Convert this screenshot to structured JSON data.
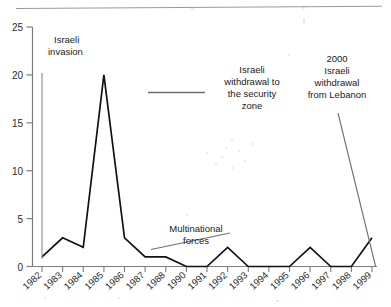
{
  "figure": {
    "top_rule": true,
    "background": "#ffffff",
    "line_color": "#111111",
    "axis_color": "#7d7d7d",
    "leader_color": "#6e6e6e"
  },
  "chart_data": {
    "type": "line",
    "title": "",
    "subtitle": "",
    "xlabel": "",
    "ylabel": "",
    "grid": false,
    "legend_position": "none",
    "ylim": [
      0,
      25
    ],
    "yticks": [
      0,
      5,
      10,
      15,
      20,
      25
    ],
    "ytick_labels": [
      "0",
      "5",
      "10",
      "15",
      "20",
      "25"
    ],
    "categories": [
      "1982",
      "1983",
      "1984",
      "1985",
      "1986",
      "1987",
      "1988",
      "1990",
      "1991",
      "1992",
      "1993",
      "1994",
      "1995",
      "1996",
      "1997",
      "1998",
      "1999"
    ],
    "series": [
      {
        "name": "Attacks",
        "values": [
          1,
          3,
          2,
          20,
          3,
          1,
          1,
          0,
          0,
          2,
          0,
          0,
          0,
          2,
          0,
          0,
          3
        ]
      }
    ],
    "annotations": [
      {
        "id": "israeli-invasion",
        "text_lines": [
          "Israeli",
          "invasion"
        ],
        "leader": "vertical-line-at-1982"
      },
      {
        "id": "israeli-withdrawal-security-zone",
        "text_lines": [
          "Israeli",
          "withdrawal to",
          "the security",
          "zone"
        ],
        "leader": "horizontal-line"
      },
      {
        "id": "multinational-forces",
        "text_lines": [
          "Multinational",
          "forces"
        ],
        "leader": "diagonal-line"
      },
      {
        "id": "withdrawal-from-lebanon-2000",
        "text_lines": [
          "2000",
          "Israeli",
          "withdrawal",
          "from Lebanon"
        ],
        "leader": "diagonal-line-to-1999"
      }
    ]
  }
}
